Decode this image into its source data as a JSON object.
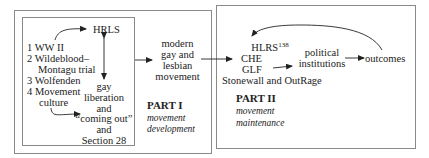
{
  "part1": {
    "heading": "PART I",
    "subtitle_line1": "movement",
    "subtitle_line2": "development",
    "factors": [
      {
        "num": "1",
        "label": "WW II"
      },
      {
        "num": "2",
        "label": "Wildeblood–"
      },
      {
        "num": "",
        "label": "Montagu trial"
      },
      {
        "num": "3",
        "label": "Wolfenden"
      },
      {
        "num": "4",
        "label": "Movement"
      },
      {
        "num": "",
        "label": "culture"
      }
    ],
    "hrls": "HRLS",
    "gay_lib": [
      "gay",
      "liberation",
      "and",
      "“coming out”",
      "and",
      "Section 28"
    ],
    "outcome": [
      "modern",
      "gay and",
      "lesbian",
      "movement"
    ]
  },
  "part2": {
    "heading": "PART II",
    "subtitle_line1": "movement",
    "subtitle_line2": "maintenance",
    "orgs": {
      "hlrs": "HLRS",
      "hlrs_sup": "138",
      "che": "CHE",
      "glf": "GLF",
      "stonewall": "Stonewall and OutRage"
    },
    "political": [
      "political",
      "institutions"
    ],
    "outcomes": "outcomes"
  },
  "colors": {
    "border": "#8a8a8a",
    "text": "#222222",
    "arrow": "#222222"
  }
}
